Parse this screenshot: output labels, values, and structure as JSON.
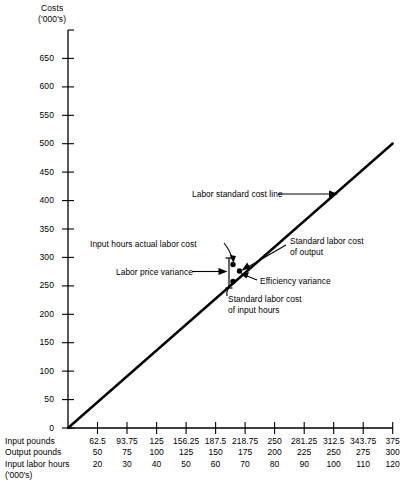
{
  "chart_data": {
    "type": "line",
    "title": "",
    "ylabel": "Costs",
    "ylabel_units": "('000's)",
    "ylim": [
      0,
      700
    ],
    "yticks": [
      0,
      50,
      100,
      150,
      200,
      250,
      300,
      350,
      400,
      450,
      500,
      550,
      600,
      650
    ],
    "ytick_labels": [
      "0",
      "50",
      "100",
      "150",
      "200",
      "250",
      "300",
      "350",
      "400",
      "450",
      "500",
      "550",
      "600",
      "650"
    ],
    "grid": false,
    "legend": "none",
    "xlim": [
      0,
      375
    ],
    "series": [
      {
        "name": "Labor standard cost line",
        "type": "line",
        "x": [
          0,
          375
        ],
        "y": [
          0,
          500
        ]
      }
    ],
    "points": [
      {
        "name": "Input hours actual labor cost",
        "x": 218.75,
        "y": 300
      },
      {
        "name": "Standard labor cost of output",
        "x": 228.0,
        "y": 292
      },
      {
        "name": "Standard labor cost of input hours",
        "x": 218.75,
        "y": 270
      }
    ],
    "annotations": [
      "Labor standard cost line",
      "Input hours actual labor cost",
      "Labor price variance",
      "Standard labor cost of output",
      "Efficiency variance",
      "Standard labor cost of input hours"
    ],
    "x_axis_table": {
      "row_labels": [
        "Input pounds",
        "Output pounds",
        "Input labor hours"
      ],
      "units_note": "('000's)",
      "rows": [
        [
          "62.5",
          "93.75",
          "125",
          "156.25",
          "187.5",
          "218.75",
          "250",
          "281.25",
          "312.5",
          "343.75",
          "375"
        ],
        [
          "50",
          "75",
          "100",
          "125",
          "150",
          "175",
          "200",
          "225",
          "250",
          "275",
          "300"
        ],
        [
          "20",
          "30",
          "40",
          "50",
          "60",
          "70",
          "80",
          "90",
          "100",
          "110",
          "120"
        ]
      ]
    }
  },
  "annotations": {
    "standard_cost_line": "Labor standard cost line",
    "input_hours_actual_labor_cost": "Input hours actual labor cost",
    "labor_price_variance": "Labor price variance",
    "standard_labor_cost_of_output_l1": "Standard labor cost",
    "standard_labor_cost_of_output_l2": "of output",
    "efficiency_variance": "Efficiency variance",
    "standard_labor_cost_of_input_hours_l1": "Standard labor cost",
    "standard_labor_cost_of_input_hours_l2": "of input hours"
  },
  "axis": {
    "y_title": "Costs",
    "y_units": "('000's)",
    "table_units": "('000's)"
  },
  "colors": {
    "ink": "#000000",
    "background": "#ffffff"
  }
}
